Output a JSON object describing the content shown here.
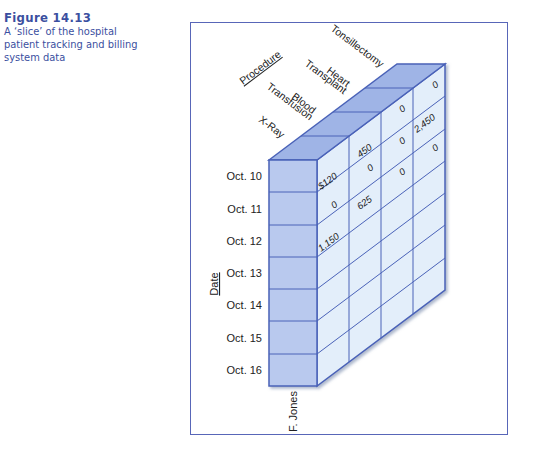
{
  "caption": {
    "figure_number": "Figure 14.13",
    "text_line1": "A ‘slice’ of the hospital",
    "text_line2": "patient tracking and billing",
    "text_line3": "system data"
  },
  "diagram": {
    "axis_procedure_label": "Procedure",
    "axis_date_label": "Date",
    "patient_label": "F. Jones",
    "procedures": [
      {
        "line1": "X-Ray",
        "line2": ""
      },
      {
        "line1": "Blood",
        "line2": "Transfusion"
      },
      {
        "line1": "Heart",
        "line2": "Transplant"
      },
      {
        "line1": "Tonsillectomy",
        "line2": ""
      }
    ],
    "dates": [
      "Oct. 10",
      "Oct. 11",
      "Oct. 12",
      "Oct. 13",
      "Oct. 14",
      "Oct. 15",
      "Oct. 16"
    ],
    "values": {
      "xray": [
        "$120",
        "0",
        "1,150"
      ],
      "blood": [
        "450",
        "0",
        "625"
      ],
      "heart": [
        "0",
        "0",
        "0"
      ],
      "tonsil": [
        "0",
        "2,450",
        "0"
      ]
    },
    "colors": {
      "front_face": "#b9c9ee",
      "top_face": "#9fb4e6",
      "side_face": "#e3eefa",
      "line": "#4a62b8"
    }
  }
}
